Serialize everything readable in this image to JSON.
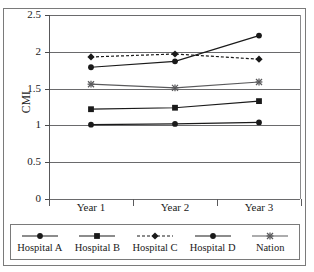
{
  "chart_data": {
    "type": "line",
    "title": "",
    "xlabel": "",
    "ylabel": "CMI",
    "categories": [
      "Year 1",
      "Year 2",
      "Year 3"
    ],
    "ylim": [
      0,
      2.5
    ],
    "ytick_labels": [
      "0",
      "0.5",
      "1",
      "1.5",
      "2",
      "2.5"
    ],
    "ytick_values": [
      0,
      0.5,
      1,
      1.5,
      2,
      2.5
    ],
    "grid": true,
    "legend_position": "bottom",
    "series": [
      {
        "name": "Hospital A",
        "marker": "circle",
        "linestyle": "solid",
        "color": "#1a1a1a",
        "values": [
          1.79,
          1.87,
          2.22
        ]
      },
      {
        "name": "Hospital B",
        "marker": "square",
        "linestyle": "solid",
        "color": "#1a1a1a",
        "values": [
          1.22,
          1.24,
          1.33
        ]
      },
      {
        "name": "Hospital C",
        "marker": "diamond",
        "linestyle": "dashed",
        "color": "#1a1a1a",
        "values": [
          1.93,
          1.97,
          1.9
        ]
      },
      {
        "name": "Hospital D",
        "marker": "circle",
        "linestyle": "solid",
        "color": "#1a1a1a",
        "values": [
          1.01,
          1.02,
          1.04
        ]
      },
      {
        "name": "Nation",
        "marker": "x",
        "linestyle": "solid",
        "color": "#5a5a5c",
        "values": [
          1.56,
          1.51,
          1.59
        ]
      }
    ]
  },
  "axis": {
    "y_label": "CMI",
    "y_ticks": [
      {
        "label": "2.5",
        "value": 2.5
      },
      {
        "label": "2",
        "value": 2
      },
      {
        "label": "1.5",
        "value": 1.5
      },
      {
        "label": "1",
        "value": 1
      },
      {
        "label": "0.5",
        "value": 0.5
      },
      {
        "label": "0",
        "value": 0
      }
    ],
    "x_ticks": [
      {
        "label": "Year 1"
      },
      {
        "label": "Year 2"
      },
      {
        "label": "Year 3"
      }
    ]
  },
  "legend": {
    "items": [
      {
        "label": "Hospital A",
        "marker": "circle",
        "linestyle": "solid"
      },
      {
        "label": "Hospital B",
        "marker": "square",
        "linestyle": "solid"
      },
      {
        "label": "Hospital C",
        "marker": "diamond",
        "linestyle": "dashed"
      },
      {
        "label": "Hospital D",
        "marker": "circle",
        "linestyle": "solid"
      },
      {
        "label": "Nation",
        "marker": "x",
        "linestyle": "solid"
      }
    ]
  }
}
